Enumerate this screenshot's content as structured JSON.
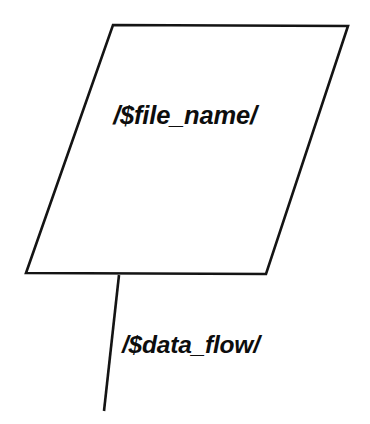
{
  "diagram": {
    "type": "data-flow-diagram",
    "background_color": "#ffffff",
    "stroke_color": "#141414",
    "text_color": "#0d0d0d",
    "nodes": [
      {
        "id": "file-store",
        "shape": "parallelogram",
        "label": "/$file_name/",
        "label_style": "bold-italic",
        "fill_color": "#ffffff",
        "points": "113,25 348,26 266,274 26,273"
      }
    ],
    "edges": [
      {
        "id": "data-flow",
        "shape": "line",
        "label": "/$data_flow/",
        "label_style": "bold-italic",
        "from_x": 119,
        "from_y": 275,
        "to_x": 104,
        "to_y": 411
      }
    ]
  }
}
